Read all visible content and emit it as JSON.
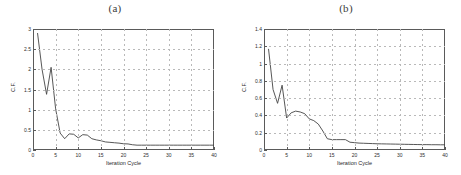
{
  "figure": {
    "background": "#ffffff",
    "axis_color": "#5a5a5a",
    "grid_color": "#b9b9b9",
    "curve_color": "#444444"
  },
  "panels": [
    {
      "caption": "(a)",
      "xlabel": "Iteration Cycle",
      "ylabel": "C.F.",
      "xticks": [
        "0",
        "5",
        "10",
        "15",
        "20",
        "25",
        "30",
        "35",
        "40"
      ],
      "yticks": [
        "0",
        "0.5",
        "1",
        "1.5",
        "2",
        "2.5",
        "3"
      ]
    },
    {
      "caption": "(b)",
      "xlabel": "Iteration Cycle",
      "ylabel": "C.F.",
      "xticks": [
        "0",
        "5",
        "10",
        "15",
        "20",
        "25",
        "30",
        "35",
        "40"
      ],
      "yticks": [
        "0",
        "0.2",
        "0.4",
        "0.6",
        "0.8",
        "1",
        "1.2",
        "1.4"
      ]
    }
  ],
  "chart_data": [
    {
      "type": "line",
      "title": "(a)",
      "xlabel": "Iteration Cycle",
      "ylabel": "C.F.",
      "xlim": [
        0,
        40
      ],
      "ylim": [
        0,
        3
      ],
      "xticks": [
        0,
        5,
        10,
        15,
        20,
        25,
        30,
        35,
        40
      ],
      "yticks": [
        0,
        0.5,
        1,
        1.5,
        2,
        2.5,
        3
      ],
      "grid": true,
      "legend": "none",
      "x": [
        1,
        2,
        3,
        4,
        5,
        6,
        7,
        8,
        9,
        10,
        11,
        12,
        13,
        14,
        15,
        16,
        17,
        18,
        19,
        20,
        21,
        22,
        23,
        24,
        25,
        26,
        27,
        28,
        29,
        30,
        31,
        32,
        33,
        34,
        35,
        36,
        37,
        38,
        39,
        40
      ],
      "y": [
        2.9,
        2.0,
        1.38,
        2.05,
        1.02,
        0.42,
        0.28,
        0.4,
        0.39,
        0.3,
        0.38,
        0.37,
        0.28,
        0.25,
        0.23,
        0.2,
        0.19,
        0.18,
        0.17,
        0.155,
        0.15,
        0.13,
        0.12,
        0.12,
        0.12,
        0.12,
        0.12,
        0.12,
        0.12,
        0.12,
        0.12,
        0.12,
        0.12,
        0.12,
        0.12,
        0.12,
        0.12,
        0.12,
        0.12,
        0.12
      ]
    },
    {
      "type": "line",
      "title": "(b)",
      "xlabel": "Iteration Cycle",
      "ylabel": "C.F.",
      "xlim": [
        0,
        40
      ],
      "ylim": [
        0,
        1.4
      ],
      "xticks": [
        0,
        5,
        10,
        15,
        20,
        25,
        30,
        35,
        40
      ],
      "yticks": [
        0,
        0.2,
        0.4,
        0.6,
        0.8,
        1.0,
        1.2,
        1.4
      ],
      "grid": true,
      "legend": "none",
      "x": [
        1,
        2,
        3,
        4,
        5,
        6,
        7,
        8,
        9,
        10,
        11,
        12,
        13,
        14,
        15,
        16,
        17,
        18,
        19,
        20,
        21,
        22,
        23,
        24,
        25,
        26,
        27,
        28,
        29,
        30,
        31,
        32,
        33,
        34,
        35,
        36,
        37,
        38,
        39,
        40
      ],
      "y": [
        1.17,
        0.7,
        0.54,
        0.75,
        0.37,
        0.43,
        0.45,
        0.44,
        0.42,
        0.36,
        0.34,
        0.3,
        0.22,
        0.13,
        0.12,
        0.12,
        0.12,
        0.12,
        0.09,
        0.085,
        0.08,
        0.078,
        0.076,
        0.074,
        0.072,
        0.071,
        0.07,
        0.069,
        0.068,
        0.067,
        0.066,
        0.065,
        0.064,
        0.063,
        0.062,
        0.062,
        0.061,
        0.061,
        0.06,
        0.06
      ]
    }
  ]
}
